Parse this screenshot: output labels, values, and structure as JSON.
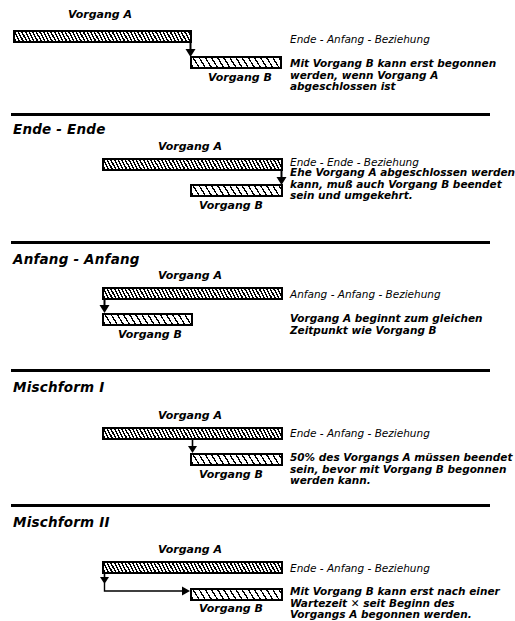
{
  "document": {
    "title": "Anordnungsbeziehungen im Netzplan",
    "language": "de"
  },
  "labels": {
    "vorgang_a": "Vorgang A",
    "vorgang_b": "Vorgang B"
  },
  "sections": [
    {
      "id": "ende-anfang",
      "heading": "",
      "relation_title": "Ende - Anfang - Beziehung",
      "description_lines": [
        "Mit Vorgang B kann erst begonnen",
        "werden, wenn Vorgang A",
        "abgeschlossen ist"
      ],
      "bar_a_label": "Vorgang A",
      "bar_b_label": "Vorgang B",
      "arrow_kind": "end-to-start"
    },
    {
      "id": "ende-ende",
      "heading": "Ende - Ende",
      "relation_title": "Ende - Ende - Beziehung",
      "description_lines": [
        "Ehe Vorgang A abgeschlossen werden",
        "kann, muß auch Vorgang B beendet",
        "sein und umgekehrt."
      ],
      "bar_a_label": "Vorgang A",
      "bar_b_label": "Vorgang B",
      "arrow_kind": "end-to-end"
    },
    {
      "id": "anfang-anfang",
      "heading": "Anfang - Anfang",
      "relation_title": "Anfang - Anfang - Beziehung",
      "description_lines": [
        "Vorgang A beginnt zum gleichen",
        "Zeitpunkt wie Vorgang B"
      ],
      "bar_a_label": "Vorgang A",
      "bar_b_label": "Vorgang B",
      "arrow_kind": "start-to-start"
    },
    {
      "id": "mischform-1",
      "heading": "Mischform I",
      "relation_title": "Ende - Anfang - Beziehung",
      "description_lines": [
        "50% des Vorgangs A müssen beendet",
        "sein, bevor mit Vorgang B begonnen",
        "werden kann."
      ],
      "bar_a_label": "Vorgang A",
      "bar_b_label": "Vorgang B",
      "arrow_kind": "mid-to-start"
    },
    {
      "id": "mischform-2",
      "heading": "Mischform II",
      "relation_title": "Ende - Anfang - Beziehung",
      "description_lines": [
        "Mit Vorgang B kann erst nach einer",
        "Wartezeit ✕ seit Beginn des",
        "Vorgangs A begonnen werden."
      ],
      "bar_a_label": "Vorgang A",
      "bar_b_label": "Vorgang B",
      "arrow_kind": "start-lag-to-start"
    }
  ],
  "style": {
    "ink": "#000000",
    "paper": "#ffffff"
  }
}
